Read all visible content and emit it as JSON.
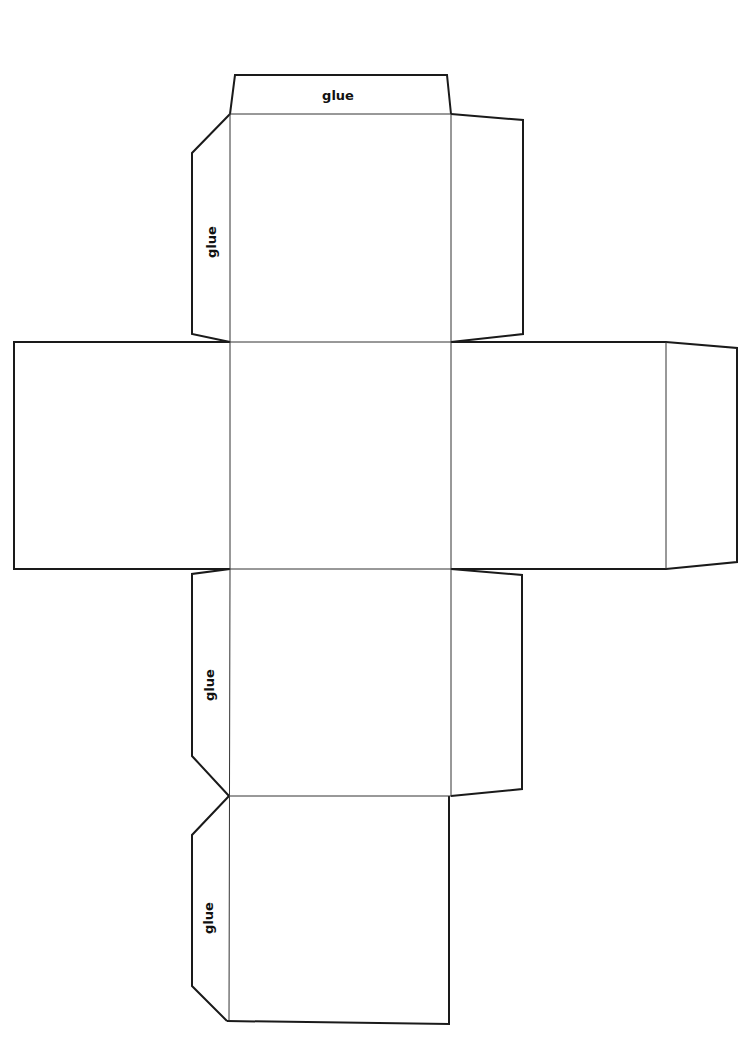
{
  "diagram": {
    "labels": {
      "top_tab": "glue",
      "left_upper_tab": "glue",
      "left_lower_tab": "glue",
      "left_bottom_tab": "glue"
    },
    "colors": {
      "line": "#1a1a1a",
      "background": "#ffffff"
    }
  }
}
